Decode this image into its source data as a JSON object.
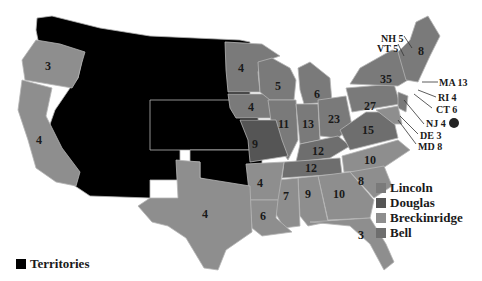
{
  "colors": {
    "lincoln": "#7a7a7a",
    "douglas": "#555555",
    "breckinridge": "#8e8e8e",
    "bell": "#6e6e6e",
    "territories": "#000000",
    "border": "#b5b5b5"
  },
  "legend": {
    "items": [
      {
        "label": "Lincoln",
        "color": "#7a7a7a"
      },
      {
        "label": "Douglas",
        "color": "#555555"
      },
      {
        "label": "Breckinridge",
        "color": "#8e8e8e"
      },
      {
        "label": "Bell",
        "color": "#6e6e6e"
      }
    ],
    "territories_label": "Territories"
  },
  "states": {
    "OR": "3",
    "CA": "4",
    "MN": "4",
    "WI": "5",
    "MI": "6",
    "IA": "4",
    "IL": "11",
    "IN": "13",
    "OH": "23",
    "PA": "27",
    "NY": "35",
    "ME": "8",
    "MO": "9",
    "KY": "12",
    "TN": "12",
    "VA": "15",
    "NC": "10",
    "SC": "8",
    "GA": "10",
    "AL": "9",
    "MS": "7",
    "AR": "4",
    "LA": "6",
    "TX": "4",
    "FL": "3"
  },
  "callouts": {
    "NH": "NH 5",
    "VT": "VT 5",
    "MA": "MA 13",
    "RI": "RI 4",
    "CT": "CT 6",
    "NJ": "NJ 4",
    "DE": "DE 3",
    "MD": "MD 8"
  }
}
